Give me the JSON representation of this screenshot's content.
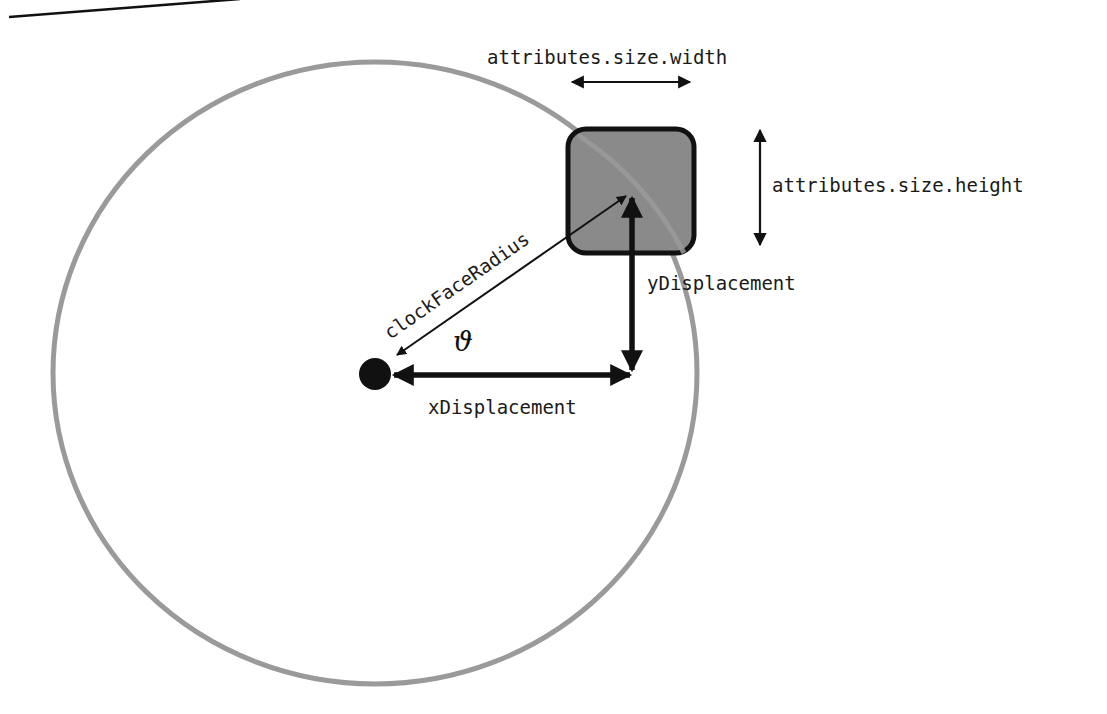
{
  "diagram": {
    "title": "",
    "colors": {
      "clock_face_stroke": "#9a9a9a",
      "marker_fill": "#8a8a8a",
      "marker_stroke": "#111111",
      "arrow": "#111111",
      "center_dot": "#111111",
      "background": "#ffffff"
    },
    "labels": {
      "width": "attributes.size.width",
      "height": "attributes.size.height",
      "radius": "clockFaceRadius",
      "angle": "ϑ",
      "x_displacement": "xDisplacement",
      "y_displacement": "yDisplacement"
    },
    "elements": {
      "clock_face": "circle",
      "marker": "rounded-square",
      "center": "dot"
    }
  }
}
